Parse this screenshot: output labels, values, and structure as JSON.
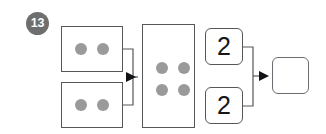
{
  "worksheet": {
    "question_number": "13",
    "type": "part-part-whole-bond",
    "colors": {
      "badge_bg": "#6e6e6e",
      "badge_text": "#ffffff",
      "box_border": "#55575a",
      "dot_fill": "#9a9a9a",
      "answer_box_border": "#6a6d72",
      "connector": "#55575a",
      "background": "#ffffff"
    }
  },
  "left_group": {
    "label": "pictorial-addends",
    "boxes": [
      {
        "name": "group-box-top",
        "dot_count": 2,
        "dots": [
          "dot",
          "dot"
        ]
      },
      {
        "name": "group-box-bottom",
        "dot_count": 2,
        "dots": [
          "dot",
          "dot"
        ]
      }
    ]
  },
  "total_box": {
    "label": "pictorial-total",
    "dot_count": 4,
    "dots": [
      "dot",
      "dot",
      "dot",
      "dot"
    ]
  },
  "right_group": {
    "label": "numeric-addends",
    "tiles": [
      {
        "name": "num-tile-top",
        "value": "2"
      },
      {
        "name": "num-tile-bottom",
        "value": "2"
      }
    ]
  },
  "answer_box": {
    "label": "numeric-total-answer",
    "value": "",
    "placeholder": ""
  },
  "connectors": {
    "left_bracket_arrow": "arrow-right",
    "right_bracket_arrow": "arrow-right"
  }
}
